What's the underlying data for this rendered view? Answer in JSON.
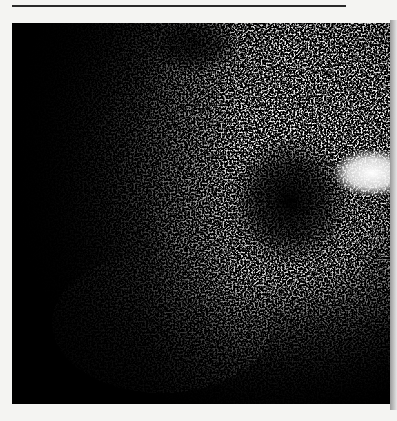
{
  "page": {
    "type": "scanned figure",
    "background_color": "#f4f4f2"
  },
  "figure": {
    "features": [
      {
        "name": "dark-left-region",
        "x": 0.1,
        "y": 0.3
      },
      {
        "name": "bright-upper-right-region",
        "x": 0.7,
        "y": 0.15
      },
      {
        "name": "dark-central-blob",
        "x": 0.73,
        "y": 0.47
      },
      {
        "name": "bright-patch-right",
        "x": 0.93,
        "y": 0.4
      },
      {
        "name": "dark-top-spot",
        "x": 0.48,
        "y": 0.06
      }
    ]
  }
}
